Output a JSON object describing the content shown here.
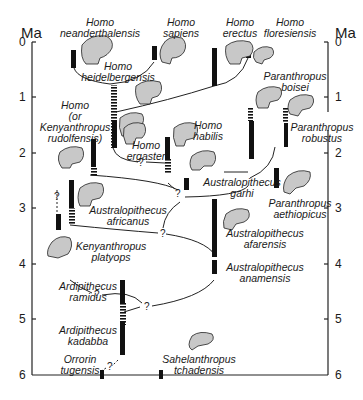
{
  "axis": {
    "unit_left": "Ma",
    "unit_right": "Ma",
    "ticks": [
      "0",
      "1",
      "2",
      "3",
      "4",
      "5",
      "6"
    ]
  },
  "species": [
    {
      "id": "neanderthalensis",
      "line1": "Homo",
      "line2": "neanderthalensis"
    },
    {
      "id": "sapiens",
      "line1": "Homo",
      "line2": "sapiens"
    },
    {
      "id": "erectus",
      "line1": "Homo",
      "line2": "erectus"
    },
    {
      "id": "floresiensis",
      "line1": "Homo",
      "line2": "floresiensis"
    },
    {
      "id": "heidelbergensis",
      "line1": "Homo",
      "line2": "heidelbergensis"
    },
    {
      "id": "boisei",
      "line1": "Paranthropus",
      "line2": "boisei"
    },
    {
      "id": "rudolfensis",
      "line1": "Homo",
      "line2": "(or",
      "line3": "Kenyanthropus",
      "line4": "rudolfensis)"
    },
    {
      "id": "robustus",
      "line1": "Paranthropus",
      "line2": "robustus"
    },
    {
      "id": "ergaster",
      "line1": "Homo",
      "line2": "ergaster"
    },
    {
      "id": "habilis",
      "line1": "Homo",
      "line2": "habilis"
    },
    {
      "id": "garhi",
      "line1": "Australopithecus",
      "line2": "garhi"
    },
    {
      "id": "aethiopicus",
      "line1": "Paranthropus",
      "line2": "aethiopicus"
    },
    {
      "id": "africanus",
      "line1": "Australopithecus",
      "line2": "africanus"
    },
    {
      "id": "afarensis",
      "line1": "Australopithecus",
      "line2": "afarensis"
    },
    {
      "id": "platyops",
      "line1": "Kenyanthropus",
      "line2": "platyops"
    },
    {
      "id": "anamensis",
      "line1": "Australopithecus",
      "line2": "anamensis"
    },
    {
      "id": "ramidus",
      "line1": "Ardipithecus",
      "line2": "ramidus"
    },
    {
      "id": "kadabba",
      "line1": "Ardipithecus",
      "line2": "kadabba"
    },
    {
      "id": "tugensis",
      "line1": "Orrorin",
      "line2": "tugensis"
    },
    {
      "id": "tchadensis",
      "line1": "Sahelanthropus",
      "line2": "tchadensis"
    }
  ],
  "uncertain_mark": "?"
}
